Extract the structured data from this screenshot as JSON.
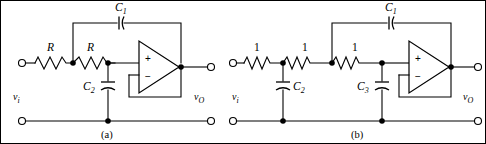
{
  "figure": {
    "caption_a": "(a)",
    "caption_b": "(b)"
  },
  "circuit_a": {
    "name": "Sallen-Key low-pass filter with general R values",
    "input_label": "v",
    "input_sub": "i",
    "output_label": "v",
    "output_sub": "O",
    "resistors": [
      {
        "label": "R"
      },
      {
        "label": "R"
      }
    ],
    "capacitors": [
      {
        "label": "C",
        "sub": "1"
      },
      {
        "label": "C",
        "sub": "2"
      }
    ],
    "opamp": {
      "plus": "+",
      "minus": "−"
    }
  },
  "circuit_b": {
    "name": "Third-order low-pass filter with normalized 1-ohm resistors",
    "input_label": "v",
    "input_sub": "i",
    "output_label": "v",
    "output_sub": "O",
    "resistors": [
      {
        "label": "1"
      },
      {
        "label": "1"
      },
      {
        "label": "1"
      }
    ],
    "capacitors": [
      {
        "label": "C",
        "sub": "1"
      },
      {
        "label": "C",
        "sub": "2"
      },
      {
        "label": "C",
        "sub": "3"
      }
    ],
    "opamp": {
      "plus": "+",
      "minus": "−"
    }
  },
  "colors": {
    "line": "#000000",
    "background": "#ffffff"
  }
}
